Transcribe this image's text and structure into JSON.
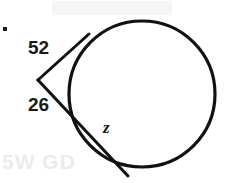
{
  "figure": {
    "kind": "geometry-diagram",
    "width": 227,
    "height": 183,
    "background_color": "#ffffff",
    "stroke_color": "#111111"
  },
  "circle": {
    "center_x": 142,
    "center_y": 94,
    "radius": 73,
    "stroke_width": 3.2,
    "fill": "none"
  },
  "external_point": {
    "x": 38,
    "y": 80
  },
  "tangent_line": {
    "from_x": 38,
    "from_y": 80,
    "to_x": 89,
    "to_y": 34,
    "stroke_width": 3.0
  },
  "secant_line": {
    "from_x": 38,
    "from_y": 80,
    "entry_x": 72,
    "entry_y": 107,
    "to_x": 128,
    "to_y": 176,
    "stroke_width": 3.0
  },
  "chord": {
    "from_x": 72,
    "from_y": 107,
    "to_x": 128,
    "to_y": 176
  },
  "labels": {
    "arc_upper": "52",
    "arc_lower": "26",
    "chord": "z"
  },
  "marks": {
    "corner_dot": "·",
    "scan_ghost_text": "5W GD"
  },
  "chart_data": {
    "type": "diagram",
    "elements": [
      {
        "name": "circle",
        "cx": 142,
        "cy": 94,
        "r": 73
      },
      {
        "name": "external-vertex",
        "x": 38,
        "y": 80
      },
      {
        "name": "tangent-ray",
        "x1": 38,
        "y1": 80,
        "x2": 89,
        "y2": 34,
        "label": "52"
      },
      {
        "name": "secant-ray",
        "x1": 38,
        "y1": 80,
        "x2": 128,
        "y2": 176,
        "label": "26"
      },
      {
        "name": "chord-segment",
        "x1": 72,
        "y1": 107,
        "x2": 128,
        "y2": 176,
        "label": "z"
      }
    ],
    "annotations": [
      "52",
      "26",
      "z"
    ]
  }
}
